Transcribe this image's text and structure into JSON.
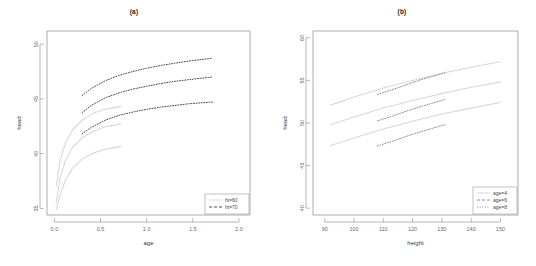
{
  "figure": {
    "width": 536,
    "height": 266,
    "background": "#ffffff"
  },
  "chart_data": [
    {
      "type": "line",
      "title": "(a)",
      "xlabel": "age",
      "ylabel": "head",
      "xlim": [
        -0.08,
        2.12
      ],
      "ylim": [
        34.4,
        51.2
      ],
      "xticks": [
        "0.0",
        "0.5",
        "1.0",
        "1.5",
        "2.0"
      ],
      "xtick_values": [
        0.0,
        0.5,
        1.0,
        1.5,
        2.0
      ],
      "yticks": [
        "50",
        "45",
        "40",
        "35"
      ],
      "ytick_values": [
        50,
        45,
        40,
        35
      ],
      "grid": false,
      "legend_position": "bottom-right",
      "legend": [
        {
          "label": "ht=60",
          "style": "solid",
          "color": "#d8d8d8"
        },
        {
          "label": "ht=70",
          "style": "dashed",
          "color": "#4d4d4d"
        }
      ],
      "series": [
        {
          "name": "ht=70 upper",
          "style": "dashed",
          "x": [
            0.3,
            0.4,
            0.55,
            0.7,
            0.85,
            1.0,
            1.15,
            1.3,
            1.45,
            1.6,
            1.7
          ],
          "y": [
            45.3,
            45.95,
            46.65,
            47.15,
            47.5,
            47.8,
            48.05,
            48.25,
            48.45,
            48.6,
            48.7
          ]
        },
        {
          "name": "ht=70 middle",
          "style": "dashed",
          "x": [
            0.3,
            0.4,
            0.55,
            0.7,
            0.85,
            1.0,
            1.15,
            1.3,
            1.45,
            1.6,
            1.72
          ],
          "y": [
            43.75,
            44.4,
            45.1,
            45.55,
            45.9,
            46.15,
            46.4,
            46.6,
            46.75,
            46.9,
            47.0
          ]
        },
        {
          "name": "ht=70 lower",
          "style": "dashed",
          "x": [
            0.3,
            0.4,
            0.55,
            0.7,
            0.85,
            1.0,
            1.15,
            1.3,
            1.45,
            1.6,
            1.72
          ],
          "y": [
            41.8,
            42.4,
            43.05,
            43.5,
            43.8,
            44.05,
            44.25,
            44.4,
            44.55,
            44.65,
            44.72
          ]
        },
        {
          "name": "ht=60 upper",
          "style": "solid",
          "x": [
            0.02,
            0.06,
            0.12,
            0.2,
            0.3,
            0.42,
            0.55,
            0.68,
            0.72
          ],
          "y": [
            37.0,
            39.3,
            41.0,
            42.2,
            43.05,
            43.7,
            44.05,
            44.25,
            44.3
          ]
        },
        {
          "name": "ht=60 middle",
          "style": "solid",
          "x": [
            0.02,
            0.06,
            0.12,
            0.2,
            0.3,
            0.42,
            0.55,
            0.68,
            0.72
          ],
          "y": [
            35.6,
            37.7,
            39.4,
            40.6,
            41.45,
            42.05,
            42.45,
            42.65,
            42.7
          ]
        },
        {
          "name": "ht=60 lower",
          "style": "solid",
          "x": [
            0.02,
            0.06,
            0.12,
            0.2,
            0.3,
            0.42,
            0.55,
            0.68,
            0.72
          ],
          "y": [
            34.9,
            36.2,
            37.6,
            38.7,
            39.5,
            40.05,
            40.4,
            40.6,
            40.65
          ]
        }
      ]
    },
    {
      "type": "line",
      "title": "(b)",
      "xlabel": "height",
      "ylabel": "head",
      "xlim": [
        86,
        156
      ],
      "ylim": [
        39.2,
        60.8
      ],
      "xticks": [
        "90",
        "100",
        "110",
        "120",
        "130",
        "140",
        "150"
      ],
      "xtick_values": [
        90,
        100,
        110,
        120,
        130,
        140,
        150
      ],
      "yticks": [
        "60",
        "55",
        "50",
        "45",
        "40"
      ],
      "ytick_values": [
        60,
        55,
        50,
        45,
        40
      ],
      "grid": false,
      "legend_position": "bottom-right",
      "legend": [
        {
          "label": "age=4",
          "style": "solid",
          "color": "#d8d8d8"
        },
        {
          "label": "age=6",
          "style": "dashed",
          "color": "#8e8e8e"
        },
        {
          "label": "age=8",
          "style": "dotted",
          "color": "#8e8e8e"
        }
      ],
      "series": [
        {
          "name": "age=4 upper",
          "style": "solid",
          "x": [
            92,
            100,
            110,
            120,
            130,
            140,
            150
          ],
          "y": [
            52.1,
            53.05,
            54.1,
            55.0,
            55.85,
            56.55,
            57.2
          ]
        },
        {
          "name": "age=4 middle",
          "style": "solid",
          "x": [
            92,
            100,
            110,
            120,
            130,
            140,
            150
          ],
          "y": [
            49.8,
            50.7,
            51.75,
            52.65,
            53.45,
            54.2,
            54.8
          ]
        },
        {
          "name": "age=4 lower",
          "style": "solid",
          "x": [
            92,
            100,
            110,
            120,
            130,
            140,
            150
          ],
          "y": [
            47.35,
            48.25,
            49.3,
            50.2,
            51.05,
            51.75,
            52.4
          ]
        },
        {
          "name": "age=8 upper",
          "style": "dotted",
          "x": [
            108,
            113,
            118,
            123,
            128,
            131
          ],
          "y": [
            53.35,
            53.9,
            54.5,
            55.1,
            55.6,
            55.9
          ]
        },
        {
          "name": "age=8 middle",
          "style": "dotted",
          "x": [
            108,
            113,
            118,
            123,
            128,
            131
          ],
          "y": [
            50.25,
            50.8,
            51.4,
            51.95,
            52.45,
            52.75
          ]
        },
        {
          "name": "age=8 lower",
          "style": "dotted",
          "x": [
            108,
            113,
            118,
            123,
            128,
            131
          ],
          "y": [
            47.3,
            47.85,
            48.45,
            49.0,
            49.5,
            49.8
          ]
        }
      ]
    }
  ]
}
